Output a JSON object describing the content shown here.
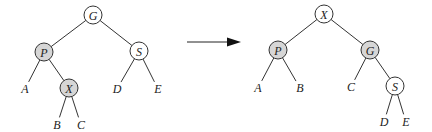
{
  "colors": {
    "shaded_fill": "#d6d6d6",
    "plain_fill": "#ffffff",
    "stroke": "#333333"
  },
  "left_tree": {
    "nodes": [
      {
        "id": "G",
        "label": "G",
        "x": 93,
        "y": 15,
        "shaded": false
      },
      {
        "id": "P",
        "label": "P",
        "x": 44,
        "y": 52,
        "shaded": true
      },
      {
        "id": "S",
        "label": "S",
        "x": 139,
        "y": 51,
        "shaded": false
      },
      {
        "id": "X",
        "label": "X",
        "x": 69,
        "y": 88,
        "shaded": true
      }
    ],
    "leaves": [
      {
        "id": "A",
        "label": "A",
        "x": 25,
        "y": 89
      },
      {
        "id": "B",
        "label": "B",
        "x": 57,
        "y": 125
      },
      {
        "id": "C",
        "label": "C",
        "x": 81,
        "y": 125
      },
      {
        "id": "D",
        "label": "D",
        "x": 117,
        "y": 89
      },
      {
        "id": "E",
        "label": "E",
        "x": 158,
        "y": 89
      }
    ],
    "edges": [
      [
        "G",
        "P"
      ],
      [
        "G",
        "S"
      ],
      [
        "P",
        "A"
      ],
      [
        "P",
        "X"
      ],
      [
        "X",
        "B"
      ],
      [
        "X",
        "C"
      ],
      [
        "S",
        "D"
      ],
      [
        "S",
        "E"
      ]
    ]
  },
  "arrow": {
    "x1": 187,
    "x2": 241,
    "y": 42
  },
  "right_tree": {
    "nodes": [
      {
        "id": "X",
        "label": "X",
        "x": 324,
        "y": 14,
        "shaded": false
      },
      {
        "id": "P",
        "label": "P",
        "x": 278,
        "y": 50,
        "shaded": true
      },
      {
        "id": "G",
        "label": "G",
        "x": 370,
        "y": 50,
        "shaded": true
      },
      {
        "id": "S",
        "label": "S",
        "x": 395,
        "y": 86,
        "shaded": false
      }
    ],
    "leaves": [
      {
        "id": "A",
        "label": "A",
        "x": 258,
        "y": 88
      },
      {
        "id": "B",
        "label": "B",
        "x": 300,
        "y": 88
      },
      {
        "id": "C",
        "label": "C",
        "x": 351,
        "y": 87
      },
      {
        "id": "D",
        "label": "D",
        "x": 384,
        "y": 122
      },
      {
        "id": "E",
        "label": "E",
        "x": 406,
        "y": 122
      }
    ],
    "edges": [
      [
        "X",
        "P"
      ],
      [
        "X",
        "G"
      ],
      [
        "P",
        "A"
      ],
      [
        "P",
        "B"
      ],
      [
        "G",
        "C"
      ],
      [
        "G",
        "S"
      ],
      [
        "S",
        "D"
      ],
      [
        "S",
        "E"
      ]
    ]
  },
  "node_radius": 9
}
